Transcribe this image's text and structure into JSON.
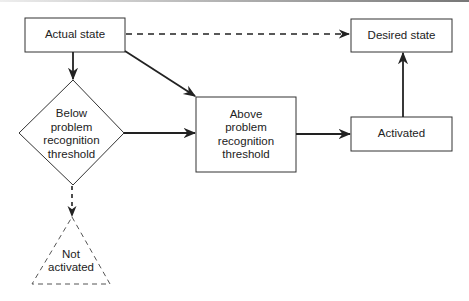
{
  "diagram": {
    "nodes": {
      "actual_state": {
        "label": "Actual state",
        "shape": "rectangle"
      },
      "desired_state": {
        "label": "Desired state",
        "shape": "rectangle"
      },
      "below_threshold": {
        "label": "Below problem recognition threshold",
        "lines": [
          "Below",
          "problem",
          "recognition",
          "threshold"
        ],
        "shape": "diamond"
      },
      "above_threshold": {
        "label": "Above problem recognition threshold",
        "lines": [
          "Above",
          "problem",
          "recognition",
          "threshold"
        ],
        "shape": "rectangle"
      },
      "activated": {
        "label": "Activated",
        "shape": "rectangle"
      },
      "not_activated": {
        "label": "Not activated",
        "lines": [
          "Not",
          "activated"
        ],
        "shape": "triangle",
        "style": "dashed"
      }
    },
    "edges": [
      {
        "from": "actual_state",
        "to": "desired_state",
        "style": "dashed"
      },
      {
        "from": "actual_state",
        "to": "below_threshold",
        "style": "solid"
      },
      {
        "from": "actual_state",
        "to": "above_threshold",
        "style": "solid"
      },
      {
        "from": "below_threshold",
        "to": "above_threshold",
        "style": "solid"
      },
      {
        "from": "below_threshold",
        "to": "not_activated",
        "style": "dashed"
      },
      {
        "from": "above_threshold",
        "to": "activated",
        "style": "solid"
      },
      {
        "from": "activated",
        "to": "desired_state",
        "style": "solid"
      }
    ]
  }
}
